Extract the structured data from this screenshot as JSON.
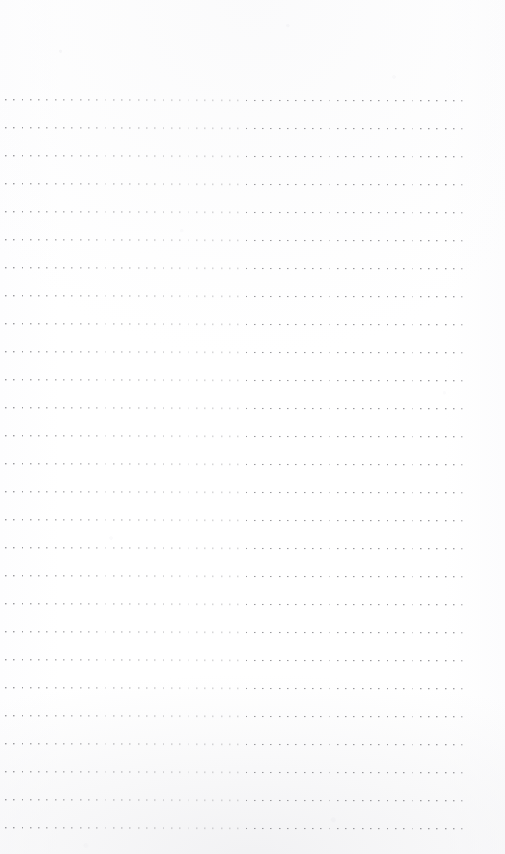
{
  "page": {
    "kind": "scanned-notebook-page",
    "width_px": 505,
    "height_px": 854,
    "background_color": "#fefefe",
    "paper_edge_shadow_color": "#f1f1f3",
    "content_text": "",
    "has_handwriting": false,
    "has_printed_text": false
  },
  "ruling": {
    "style": "dotted",
    "line_count": 27,
    "first_line_y": 99,
    "line_spacing_px": 28,
    "left_margin_px": 5,
    "right_edge_px": 470,
    "line_length_px": 465,
    "dot_color": "#9a9a9e",
    "dot_size_px": 1.4,
    "dot_spacing_px": 8.3,
    "skew_deg": 0.12,
    "top_margin_px": 99,
    "bottom_margin_px": 35
  },
  "annotations": {
    "empty_state_label": ""
  }
}
